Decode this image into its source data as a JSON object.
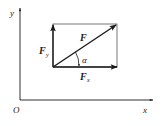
{
  "diagram": {
    "type": "vector-decomposition",
    "axes": {
      "x_label": "x",
      "y_label": "y",
      "origin_label": "O"
    },
    "vectors": {
      "resultant": {
        "label": "F"
      },
      "x_component": {
        "label": "F",
        "subscript": "x"
      },
      "y_component": {
        "label": "F",
        "subscript": "y"
      }
    },
    "angle": {
      "label": "α"
    },
    "colors": {
      "line": "#1a1a1a",
      "rectangle": "#555555",
      "background": "#ffffff"
    }
  }
}
